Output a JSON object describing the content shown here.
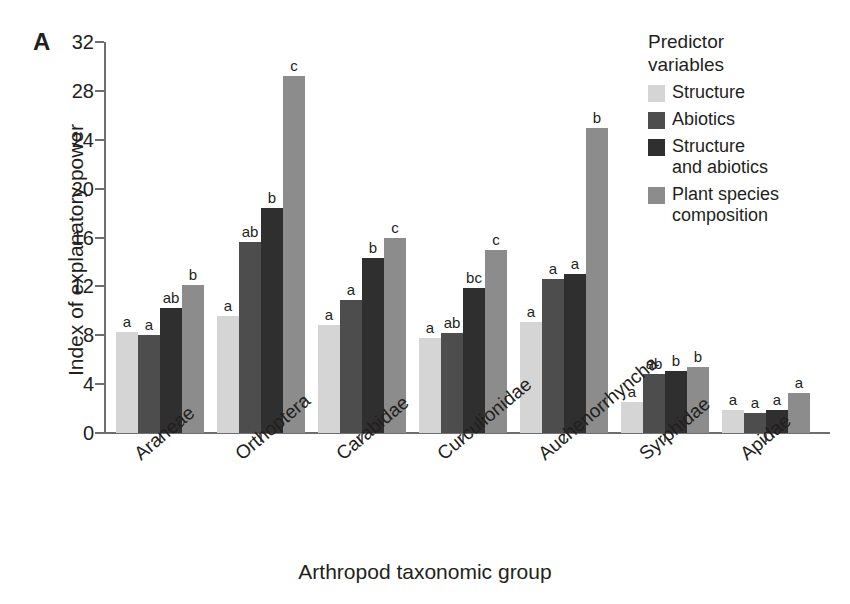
{
  "panel_label": "A",
  "legend": {
    "title": "Predictor\nvariables",
    "items": [
      {
        "label": "Structure",
        "color": "#d5d5d5"
      },
      {
        "label": "Abiotics",
        "color": "#4d4d4d"
      },
      {
        "label": "Structure\nand abiotics",
        "color": "#2f2f2f"
      },
      {
        "label": "Plant species\ncomposition",
        "color": "#8c8c8c"
      }
    ]
  },
  "chart_data": {
    "type": "bar",
    "title": "",
    "xlabel": "Arthropod taxonomic group",
    "ylabel": "Index of explanatory power",
    "ylim": [
      0,
      32
    ],
    "yticks": [
      0,
      4,
      8,
      12,
      16,
      20,
      24,
      28,
      32
    ],
    "grid": false,
    "legend_position": "top-right",
    "categories": [
      "Araneae",
      "Orthoptera",
      "Carabidae",
      "Curculionidae",
      "Auchenorrhyncha",
      "Syrphidae",
      "Apidae"
    ],
    "series": [
      {
        "name": "Structure",
        "color": "#d5d5d5",
        "values": [
          8.3,
          9.6,
          8.8,
          7.8,
          9.1,
          2.5,
          1.9
        ],
        "labels": [
          "a",
          "a",
          "a",
          "a",
          "a",
          "a",
          "a"
        ]
      },
      {
        "name": "Abiotics",
        "color": "#4d4d4d",
        "values": [
          8.0,
          15.6,
          10.9,
          8.2,
          12.6,
          4.8,
          1.6
        ],
        "labels": [
          "a",
          "ab",
          "a",
          "ab",
          "a",
          "ab",
          "a"
        ]
      },
      {
        "name": "Structure and abiotics",
        "color": "#2f2f2f",
        "values": [
          10.2,
          18.4,
          14.3,
          11.9,
          13.0,
          5.1,
          1.9
        ],
        "labels": [
          "ab",
          "b",
          "b",
          "bc",
          "a",
          "b",
          "a"
        ]
      },
      {
        "name": "Plant species composition",
        "color": "#8c8c8c",
        "values": [
          12.1,
          29.2,
          16.0,
          15.0,
          25.0,
          5.4,
          3.3
        ],
        "labels": [
          "b",
          "c",
          "c",
          "c",
          "b",
          "b",
          "a"
        ]
      }
    ]
  }
}
